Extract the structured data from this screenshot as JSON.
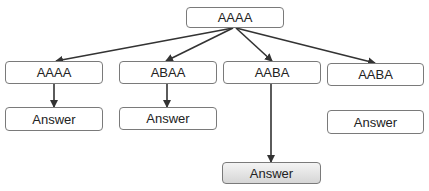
{
  "diagram": {
    "root": {
      "label": "AAAA"
    },
    "level2": [
      {
        "label": "AAAA"
      },
      {
        "label": "ABAA"
      },
      {
        "label": "AABA"
      },
      {
        "label": "AABA"
      }
    ],
    "answers": [
      {
        "label": "Answer",
        "highlighted": false
      },
      {
        "label": "Answer",
        "highlighted": false
      },
      {
        "label": "Answer",
        "highlighted": false
      },
      {
        "label": "Answer",
        "highlighted": true
      }
    ],
    "edges": [
      {
        "from": "root",
        "to": "level2.0"
      },
      {
        "from": "root",
        "to": "level2.1"
      },
      {
        "from": "root",
        "to": "level2.2"
      },
      {
        "from": "root",
        "to": "level2.3"
      },
      {
        "from": "level2.0",
        "to": "answers.0"
      },
      {
        "from": "level2.1",
        "to": "answers.1"
      },
      {
        "from": "level2.2",
        "to": "answers.3"
      }
    ]
  }
}
